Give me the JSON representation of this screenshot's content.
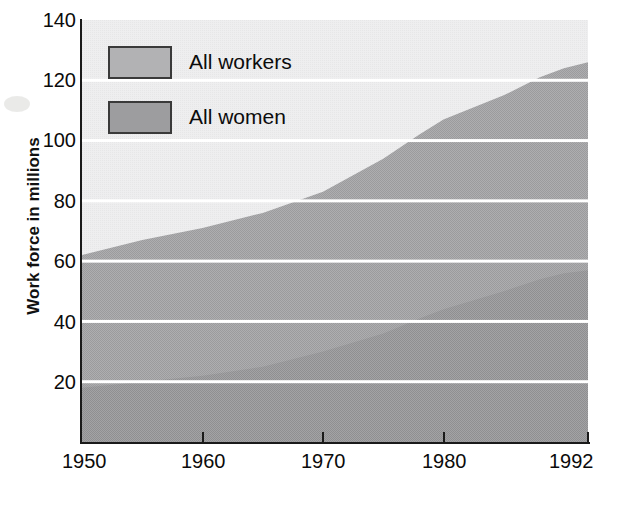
{
  "chart_data": {
    "type": "area",
    "stacked": true,
    "title": "",
    "xlabel": "",
    "ylabel": "Work force in millions",
    "xlim": [
      1950,
      1992
    ],
    "ylim": [
      0,
      140
    ],
    "grid": true,
    "grid_color": "#ffffff",
    "legend_position": "top-left-inside",
    "x_ticks": [
      1950,
      1960,
      1970,
      1980,
      1992
    ],
    "x_tick_labels": [
      "1950",
      "1960",
      "1970",
      "1980",
      "1992"
    ],
    "y_ticks": [
      20,
      40,
      60,
      80,
      100,
      120,
      140
    ],
    "y_tick_labels": [
      "20",
      "40",
      "60",
      "80",
      "100",
      "120",
      "140"
    ],
    "x": [
      1950,
      1955,
      1960,
      1965,
      1970,
      1975,
      1978,
      1980,
      1985,
      1988,
      1990,
      1992
    ],
    "series": [
      {
        "name": "All workers",
        "color": "#a9a9ab",
        "values": [
          62,
          67,
          71,
          76,
          83,
          94,
          102,
          107,
          115,
          121,
          124,
          126
        ]
      },
      {
        "name": "All women",
        "color": "#9c9c9e",
        "values": [
          18,
          20,
          22,
          25,
          30,
          36,
          41,
          44,
          50,
          54,
          56,
          57
        ]
      }
    ]
  },
  "legend": {
    "items": [
      {
        "label": "All workers",
        "swatch_color": "#b4b4b6"
      },
      {
        "label": "All women",
        "swatch_color": "#9d9d9f"
      }
    ]
  },
  "axes": {
    "y_title": "Work force in millions",
    "y_labels": [
      "140",
      "120",
      "100",
      "80",
      "60",
      "40",
      "20"
    ],
    "x_labels": [
      "1950",
      "1960",
      "1970",
      "1980",
      "1992"
    ]
  },
  "colors": {
    "background_upper": "#ececed",
    "workers_band": "#a9a9ab",
    "women_band": "#9b9b9d",
    "gridline": "#ffffff",
    "axis": "#1a1a1a",
    "text": "#0b0b0b"
  }
}
